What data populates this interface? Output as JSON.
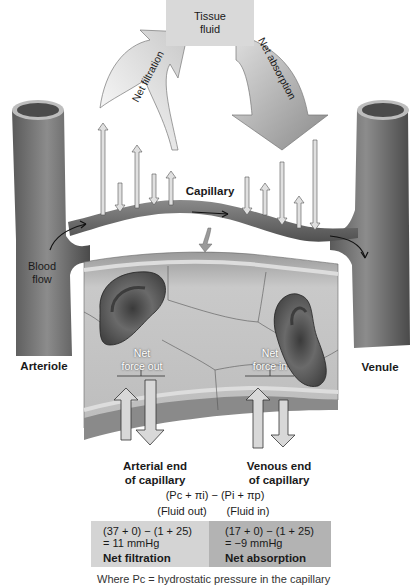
{
  "diagram": {
    "tissue_fluid": {
      "line1": "Tissue",
      "line2": "fluid"
    },
    "arrows": {
      "net_filtration": "Net filtration",
      "net_absorption": "Net absorption"
    },
    "vessels": {
      "capillary": "Capillary",
      "arteriole": "Arteriole",
      "venule": "Venule",
      "blood_flow_line1": "Blood",
      "blood_flow_line2": "flow"
    },
    "detail": {
      "net_force_out_line1": "Net",
      "net_force_out_line2": "force out",
      "net_force_in_line1": "Net",
      "net_force_in_line2": "force in"
    },
    "ends": {
      "arterial_line1": "Arterial end",
      "arterial_line2": "of capillary",
      "venous_line1": "Venous end",
      "venous_line2": "of capillary"
    },
    "equation": {
      "formula": "(Pc + πi) − (Pi + πp)",
      "fluid_out": "(Fluid out)",
      "fluid_in": "(Fluid in)"
    },
    "table": {
      "arterial": {
        "expr": "(37 + 0) − (1 + 25)",
        "value": "= 11 mmHg",
        "result": "Net filtration"
      },
      "venous": {
        "expr": "(17 + 0) − (1 + 25)",
        "value": "= −9 mmHg",
        "result": "Net absorption"
      }
    },
    "footnote": "Where Pc = hydrostatic pressure in the capillary"
  },
  "colors": {
    "tissue_box": "#d9d9d9",
    "table_left": "#d4d4d4",
    "table_right": "#b3b3b3",
    "vessel": "#6e6e6e"
  }
}
